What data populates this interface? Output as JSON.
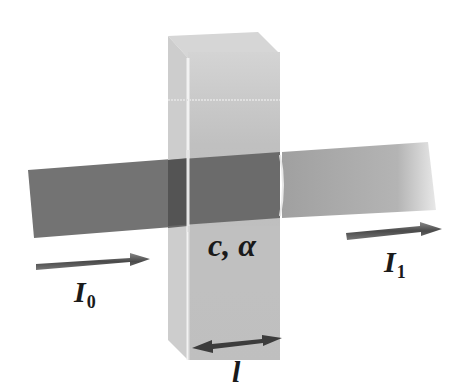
{
  "diagram": {
    "labels": {
      "incident_main": "I",
      "incident_sub": "0",
      "transmitted_main": "I",
      "transmitted_sub": "1",
      "sample": "c, α",
      "path_length": "l"
    },
    "elements": [
      {
        "id": "incident-beam",
        "description": "dark grey beam entering from left"
      },
      {
        "id": "cuvette",
        "description": "translucent rectangular cuvette"
      },
      {
        "id": "transmitted-beam",
        "description": "lighter grey beam exiting right, fading"
      },
      {
        "id": "incident-arrow",
        "description": "arrow pointing right under I0"
      },
      {
        "id": "transmitted-arrow",
        "description": "arrow pointing right above I1"
      },
      {
        "id": "path-length-arrow",
        "description": "double-headed arrow under cuvette labelled l"
      }
    ],
    "colors": {
      "incident_beam": "#707070",
      "inside_beam": "#5a5a5a",
      "transmitted_beam": "#a8a8a8",
      "cuvette": "#c4c4c4",
      "cuvette_top": "#d8d8d8",
      "arrow": "#555555",
      "text": "#1a1a1a"
    }
  }
}
